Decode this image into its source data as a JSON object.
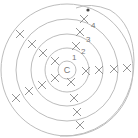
{
  "diagram": {
    "center_label": "C",
    "ring_labels": [
      "1",
      "2",
      "3",
      "4"
    ],
    "line_color": "#bdbdbd",
    "mark_color": "#8a8a8a",
    "text_color": "#777777",
    "center": [
      67,
      70
    ],
    "rings": [
      {
        "r": 9
      },
      {
        "r": 22
      },
      {
        "r": 36
      },
      {
        "r": 51
      },
      {
        "r": 66
      }
    ],
    "marks": [
      [
        20,
        34
      ],
      [
        32,
        44
      ],
      [
        43,
        53
      ],
      [
        55,
        61
      ],
      [
        55,
        78
      ],
      [
        42,
        85
      ],
      [
        29,
        91
      ],
      [
        16,
        98
      ],
      [
        71,
        82
      ],
      [
        74,
        98
      ],
      [
        77,
        112
      ],
      [
        80,
        125
      ],
      [
        86,
        71
      ],
      [
        99,
        70
      ],
      [
        114,
        69
      ],
      [
        127,
        68
      ],
      [
        76,
        46
      ],
      [
        80,
        32
      ],
      [
        84,
        19
      ]
    ],
    "labels": [
      {
        "text": "4",
        "x": 91,
        "y": 28
      },
      {
        "text": "3",
        "x": 86,
        "y": 42
      },
      {
        "text": "2",
        "x": 81,
        "y": 54
      },
      {
        "text": "1",
        "x": 72,
        "y": 60
      }
    ],
    "dot": [
      88,
      10
    ]
  }
}
